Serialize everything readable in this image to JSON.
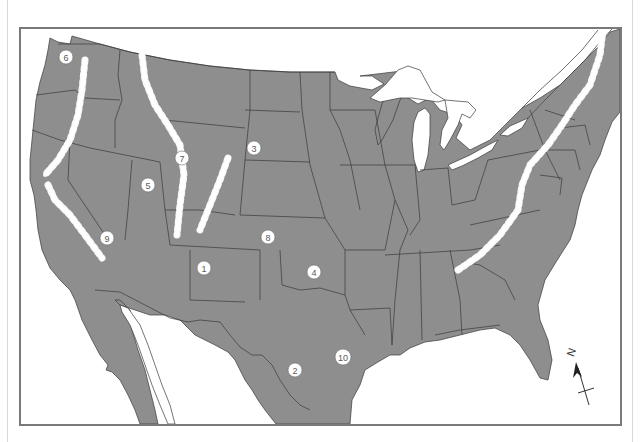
{
  "map": {
    "subject": "Contiguous United States with mountain ranges and numbered locations",
    "colors": {
      "land": "#8e8e8e",
      "water": "#ffffff",
      "borders": "#3a3a3a",
      "mountains": "#ffffff",
      "frame": "#7a7a7a"
    },
    "markers": [
      {
        "id": "1",
        "label": "1",
        "x": 204,
        "y": 268
      },
      {
        "id": "2",
        "label": "2",
        "x": 295,
        "y": 370
      },
      {
        "id": "3",
        "label": "3",
        "x": 254,
        "y": 148
      },
      {
        "id": "4",
        "label": "4",
        "x": 314,
        "y": 272
      },
      {
        "id": "5",
        "label": "5",
        "x": 148,
        "y": 185
      },
      {
        "id": "6",
        "label": "6",
        "x": 66,
        "y": 57
      },
      {
        "id": "7",
        "label": "7",
        "x": 182,
        "y": 158
      },
      {
        "id": "8",
        "label": "8",
        "x": 268,
        "y": 237
      },
      {
        "id": "9",
        "label": "9",
        "x": 107,
        "y": 238
      },
      {
        "id": "10",
        "label": "10",
        "x": 343,
        "y": 357
      }
    ],
    "mountain_ranges": [
      "cascade-range",
      "sierra-nevada",
      "northern-rockies",
      "southern-rockies",
      "appalachians"
    ],
    "compass": {
      "label": "N",
      "icon": "north-arrow-icon"
    }
  }
}
